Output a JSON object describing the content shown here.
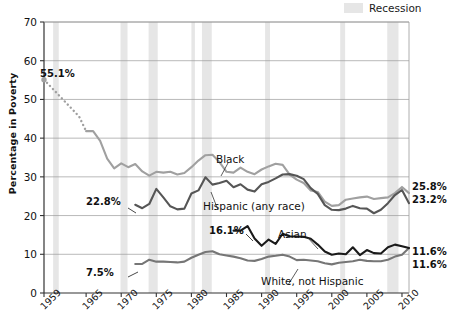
{
  "legend": {
    "swatch_name": "recession-band",
    "label": "Recession",
    "swatch_color": "#e6e6e6",
    "position": "top-right"
  },
  "axes": {
    "ylabel": "Percentage in Poverty",
    "yticks": [
      0,
      10,
      20,
      30,
      40,
      50,
      60,
      70
    ],
    "ylim": [
      0,
      70
    ],
    "xticks": [
      1959,
      1965,
      1970,
      1975,
      1980,
      1985,
      1990,
      1995,
      2000,
      2005,
      2010
    ],
    "xlim": [
      1959,
      2011
    ],
    "grid": "horizontal"
  },
  "annotations": {
    "start_black": "55.1%",
    "start_hispanic": "22.8%",
    "start_white": "7.5%",
    "start_asian": "16.1%"
  },
  "series_labels": {
    "black": "Black",
    "hispanic": "Hispanic (any race)",
    "asian": "Asian",
    "white": "White, not Hispanic"
  },
  "end_labels": {
    "black": "25.8%",
    "hispanic": "23.2%",
    "asian": "11.6%",
    "white": "11.6%"
  },
  "chart_data": {
    "type": "line",
    "title": "",
    "xlabel": "",
    "ylabel": "Percentage in Poverty",
    "ylim": [
      0,
      70
    ],
    "xlim": [
      1959,
      2011
    ],
    "grid": true,
    "legend_position": "top-right",
    "x": [
      1959,
      1960,
      1961,
      1962,
      1963,
      1964,
      1965,
      1966,
      1967,
      1968,
      1969,
      1970,
      1971,
      1972,
      1973,
      1974,
      1975,
      1976,
      1977,
      1978,
      1979,
      1980,
      1981,
      1982,
      1983,
      1984,
      1985,
      1986,
      1987,
      1988,
      1989,
      1990,
      1991,
      1992,
      1993,
      1994,
      1995,
      1996,
      1997,
      1998,
      1999,
      2000,
      2001,
      2002,
      2003,
      2004,
      2005,
      2006,
      2007,
      2008,
      2009,
      2010,
      2011
    ],
    "series": [
      {
        "name": "Black",
        "color": "#a0a0a0",
        "dashed_until": 1965,
        "start_value": 55.1,
        "end_value": 25.8,
        "values": [
          55.1,
          53.2,
          51.3,
          49.4,
          47.5,
          45.6,
          41.8,
          41.8,
          39.3,
          34.7,
          32.2,
          33.5,
          32.5,
          33.3,
          31.4,
          30.3,
          31.3,
          31.1,
          31.3,
          30.6,
          31.0,
          32.5,
          34.2,
          35.6,
          35.7,
          33.8,
          31.3,
          31.1,
          32.4,
          31.3,
          30.7,
          31.9,
          32.7,
          33.4,
          33.1,
          30.6,
          29.3,
          28.4,
          26.5,
          26.1,
          23.6,
          22.5,
          22.7,
          24.1,
          24.4,
          24.7,
          24.9,
          24.3,
          24.5,
          24.7,
          25.8,
          27.4,
          25.8
        ]
      },
      {
        "name": "Hispanic (any race)",
        "color": "#565656",
        "start_value": 22.8,
        "end_value": 23.2,
        "values": [
          null,
          null,
          null,
          null,
          null,
          null,
          null,
          null,
          null,
          null,
          null,
          null,
          null,
          22.8,
          21.9,
          23.0,
          26.9,
          24.7,
          22.4,
          21.6,
          21.8,
          25.7,
          26.5,
          29.9,
          28.0,
          28.4,
          29.0,
          27.3,
          28.1,
          26.7,
          26.2,
          28.1,
          28.7,
          29.6,
          30.6,
          30.7,
          30.3,
          29.4,
          27.1,
          25.6,
          22.7,
          21.5,
          21.4,
          21.8,
          22.5,
          21.9,
          21.8,
          20.6,
          21.5,
          23.2,
          25.3,
          26.6,
          23.2
        ]
      },
      {
        "name": "Asian",
        "color": "#1a1a1a",
        "start_value": 16.1,
        "end_value": 11.6,
        "values": [
          null,
          null,
          null,
          null,
          null,
          null,
          null,
          null,
          null,
          null,
          null,
          null,
          null,
          null,
          null,
          null,
          null,
          null,
          null,
          null,
          null,
          null,
          null,
          null,
          null,
          null,
          null,
          16.1,
          16.1,
          17.3,
          14.1,
          12.2,
          13.8,
          12.7,
          15.3,
          14.6,
          14.6,
          14.5,
          14.0,
          12.5,
          10.7,
          9.9,
          10.2,
          10.0,
          11.8,
          9.8,
          11.1,
          10.3,
          10.2,
          11.8,
          12.5,
          12.1,
          11.6
        ]
      },
      {
        "name": "White, not Hispanic",
        "color": "#767676",
        "start_value": 7.5,
        "end_value": 11.6,
        "values": [
          null,
          null,
          null,
          null,
          null,
          null,
          null,
          null,
          null,
          null,
          null,
          null,
          null,
          7.5,
          7.5,
          8.6,
          8.1,
          8.1,
          8.0,
          7.9,
          8.1,
          9.1,
          9.9,
          10.6,
          10.8,
          10.0,
          9.7,
          9.4,
          9.0,
          8.4,
          8.3,
          8.8,
          9.4,
          9.6,
          9.9,
          9.4,
          8.5,
          8.6,
          8.4,
          8.2,
          7.7,
          7.4,
          7.8,
          8.0,
          8.2,
          8.6,
          8.3,
          8.2,
          8.2,
          8.6,
          9.4,
          9.9,
          11.6
        ]
      }
    ],
    "recession_bands": [
      [
        1960.3,
        1961.1
      ],
      [
        1969.9,
        1970.9
      ],
      [
        1973.9,
        1975.2
      ],
      [
        1980.0,
        1980.5
      ],
      [
        1981.5,
        1982.9
      ],
      [
        1990.5,
        1991.2
      ],
      [
        2001.2,
        2001.9
      ],
      [
        2007.9,
        2009.5
      ]
    ]
  }
}
